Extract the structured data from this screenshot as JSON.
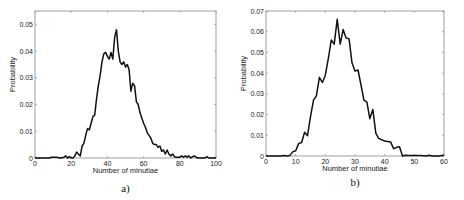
{
  "chart_data": [
    {
      "type": "line",
      "panel": "a)",
      "title": "",
      "xlabel": "Number of minutiae",
      "ylabel": "Probability",
      "xlim": [
        0,
        100
      ],
      "ylim": [
        0,
        0.055
      ],
      "xticks": [
        0,
        20,
        40,
        60,
        80,
        100
      ],
      "yticks": [
        0,
        0.01,
        0.02,
        0.03,
        0.04,
        0.05
      ],
      "ytick_labels": [
        "0",
        "0.01",
        "0.02",
        "0.03",
        "0.04",
        "0.05"
      ],
      "grid": false,
      "x": [
        0,
        5,
        8,
        9,
        10,
        12,
        14,
        16,
        17,
        18,
        19,
        20,
        21,
        22,
        23,
        24,
        25,
        26,
        27,
        28,
        29,
        30,
        31,
        32,
        33,
        34,
        35,
        36,
        37,
        38,
        39,
        40,
        41,
        42,
        43,
        44,
        45,
        46,
        47,
        48,
        49,
        50,
        51,
        52,
        53,
        54,
        55,
        56,
        57,
        58,
        59,
        60,
        61,
        62,
        63,
        64,
        65,
        66,
        67,
        68,
        69,
        70,
        71,
        72,
        73,
        74,
        75,
        76,
        77,
        78,
        79,
        80,
        81,
        82,
        83,
        84,
        85,
        86,
        87,
        88,
        89,
        90,
        92,
        94,
        95,
        96,
        98,
        100
      ],
      "values": [
        0,
        0,
        0,
        0.0003,
        0.0003,
        0.0003,
        0,
        0.0003,
        0.0008,
        0,
        0.0005,
        0,
        0,
        0.0008,
        0.0022,
        0.0015,
        0.0008,
        0.0045,
        0.0055,
        0.0085,
        0.011,
        0.0105,
        0.013,
        0.0155,
        0.016,
        0.022,
        0.027,
        0.031,
        0.036,
        0.039,
        0.0395,
        0.038,
        0.037,
        0.0395,
        0.037,
        0.045,
        0.048,
        0.04,
        0.036,
        0.035,
        0.036,
        0.034,
        0.035,
        0.033,
        0.025,
        0.028,
        0.027,
        0.021,
        0.02,
        0.017,
        0.015,
        0.013,
        0.0115,
        0.0095,
        0.0085,
        0.0075,
        0.0055,
        0.005,
        0.005,
        0.004,
        0.0045,
        0.0025,
        0.003,
        0.0015,
        0.003,
        0.0015,
        0.0008,
        0.0015,
        0.0005,
        0.0003,
        0.0003,
        0.0003,
        0.0008,
        0.0003,
        0.0008,
        0.0003,
        0.0008,
        0,
        0.0005,
        0.0008,
        0.0003,
        0,
        0,
        0,
        0.0005,
        0,
        0,
        0
      ]
    },
    {
      "type": "line",
      "panel": "b)",
      "title": "",
      "xlabel": "Number of minutiae",
      "ylabel": "Probability",
      "xlim": [
        0,
        60
      ],
      "ylim": [
        0,
        0.07
      ],
      "xticks": [
        0,
        10,
        20,
        30,
        40,
        50,
        60
      ],
      "yticks": [
        0,
        0.01,
        0.02,
        0.03,
        0.04,
        0.05,
        0.06,
        0.07
      ],
      "ytick_labels": [
        "0",
        "0.01",
        "0.02",
        "0.03",
        "0.04",
        "0.05",
        "0.06",
        "0.07"
      ],
      "grid": false,
      "x": [
        0,
        5,
        6,
        7,
        8,
        9,
        10,
        11,
        12,
        13,
        14,
        15,
        16,
        17,
        18,
        19,
        20,
        21,
        22,
        23,
        24,
        25,
        26,
        27,
        28,
        29,
        30,
        31,
        32,
        33,
        34,
        35,
        36,
        37,
        38,
        39,
        40,
        41,
        42,
        43,
        44,
        45,
        46,
        47,
        48,
        50,
        52,
        54,
        55,
        56,
        58,
        60
      ],
      "values": [
        0,
        0,
        0.0002,
        0,
        0.0002,
        0.002,
        0.0025,
        0.006,
        0.0065,
        0.0115,
        0.0098,
        0.019,
        0.027,
        0.029,
        0.038,
        0.0355,
        0.039,
        0.047,
        0.056,
        0.054,
        0.066,
        0.054,
        0.061,
        0.057,
        0.0565,
        0.045,
        0.041,
        0.0415,
        0.0345,
        0.027,
        0.026,
        0.018,
        0.0225,
        0.011,
        0.0085,
        0.0078,
        0.0072,
        0.007,
        0.0068,
        0.0035,
        0.0042,
        0.0045,
        0,
        0.0004,
        0.0002,
        0.0002,
        0.0002,
        0,
        0.0004,
        0,
        0,
        0.0004
      ]
    }
  ]
}
